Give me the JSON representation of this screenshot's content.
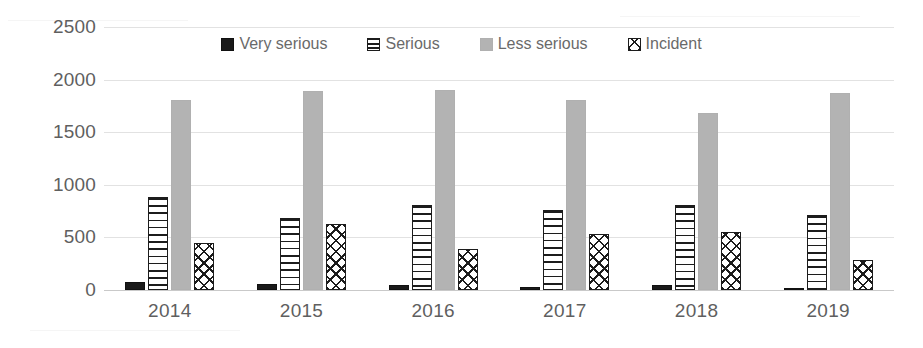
{
  "chart_data": {
    "type": "bar",
    "title": "",
    "subtitle": "",
    "xlabel": "",
    "ylabel": "",
    "categories": [
      "2014",
      "2015",
      "2016",
      "2017",
      "2018",
      "2019"
    ],
    "ylim": [
      0,
      2500
    ],
    "yticks": [
      0,
      500,
      1000,
      1500,
      2000,
      2500
    ],
    "ytick_labels": [
      "0",
      "500",
      "1000",
      "1500",
      "2000",
      "2500"
    ],
    "grid": true,
    "legend_position": "top-center",
    "series": [
      {
        "name": "Very serious",
        "pattern": "solid-black",
        "color": "#1a1a1a",
        "values": [
          75,
          55,
          45,
          25,
          50,
          20
        ]
      },
      {
        "name": "Serious",
        "pattern": "horizontal-lines",
        "color": "#1c1c1c",
        "values": [
          880,
          680,
          805,
          765,
          810,
          710
        ]
      },
      {
        "name": "Less serious",
        "pattern": "solid-gray",
        "color": "#b3b3b3",
        "values": [
          1810,
          1890,
          1900,
          1810,
          1680,
          1870
        ]
      },
      {
        "name": "Incident",
        "pattern": "diagonal-crosshatch",
        "color": "#1c1c1c",
        "values": [
          450,
          630,
          390,
          530,
          550,
          290
        ]
      }
    ],
    "annotations": []
  },
  "legend": {
    "items": [
      {
        "label": "Very serious",
        "swatch": "solid-black-swatch"
      },
      {
        "label": "Serious",
        "swatch": "horizontal-lines-swatch"
      },
      {
        "label": "Less serious",
        "swatch": "solid-gray-swatch"
      },
      {
        "label": "Incident",
        "swatch": "diagonal-crosshatch-swatch"
      }
    ]
  },
  "colors": {
    "very_serious": "#1a1a1a",
    "serious": "#1c1c1c",
    "less_serious": "#b3b3b3",
    "incident": "#1c1c1c",
    "gridline": "#e2e2e2",
    "axis_text": "#5f5f5f",
    "background": "#ffffff"
  }
}
